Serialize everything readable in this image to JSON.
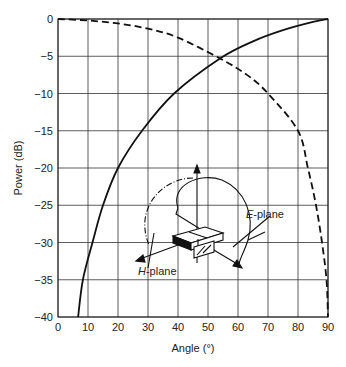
{
  "chart_data": {
    "type": "line",
    "title": "",
    "xlabel": "Angle (°)",
    "ylabel": "Power (dB)",
    "xlim": [
      0,
      90
    ],
    "ylim": [
      -40,
      0
    ],
    "xticks": [
      0,
      10,
      20,
      30,
      40,
      50,
      60,
      70,
      80,
      90
    ],
    "yticks": [
      0,
      -5,
      -10,
      -15,
      -20,
      -25,
      -30,
      -35,
      -40
    ],
    "ytick_labels": [
      "0",
      "−5",
      "−10",
      "−15",
      "−20",
      "−25",
      "−30",
      "−35",
      "−40"
    ],
    "grid": true,
    "series": [
      {
        "name": "E-plane",
        "style": "solid",
        "x": [
          6.7,
          8.3,
          11.5,
          15,
          20,
          28,
          38.7,
          54,
          65,
          75,
          85,
          90
        ],
        "y": [
          -40,
          -35,
          -30,
          -25,
          -20,
          -15,
          -10,
          -5.3,
          -3,
          -1.5,
          -0.4,
          0
        ]
      },
      {
        "name": "H-plane",
        "style": "dashed",
        "x": [
          0,
          10,
          20,
          30,
          40,
          54,
          63,
          70,
          80,
          83.3,
          86,
          88,
          89.5,
          90
        ],
        "y": [
          0,
          -0.2,
          -0.6,
          -1.3,
          -2.5,
          -5.3,
          -7.5,
          -10,
          -15,
          -20,
          -25,
          -30,
          -35,
          -40
        ]
      }
    ],
    "annotations": [
      {
        "text": "E-plane",
        "italic_prefix": "E",
        "rest": "-plane"
      },
      {
        "text": "H-plane",
        "italic_prefix": "H",
        "rest": "-plane"
      }
    ],
    "inset": "Waveguide aperture sketch with E-plane (solid arc) and H-plane (dash-dot arc) orientation arrows"
  },
  "labels": {
    "xlabel": "Angle (°)",
    "ylabel": "Power (dB)",
    "e_italic": "E",
    "e_rest": "-plane",
    "h_italic": "H",
    "h_rest": "-plane"
  }
}
